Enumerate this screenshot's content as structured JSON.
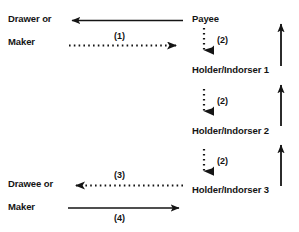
{
  "diagram": {
    "background_color": "#ffffff",
    "ink_color": "#141414",
    "nodes": {
      "drawer": {
        "line1": "Drawer or",
        "line2": "Maker"
      },
      "drawee": {
        "line1": "Drawee or",
        "line2": "Maker"
      },
      "payee": "Payee",
      "holder1": "Holder/Indorser 1",
      "holder2": "Holder/Indorser 2",
      "holder3": "Holder/Indorser 3"
    },
    "edge_labels": {
      "e1": "(1)",
      "e2a": "(2)",
      "e2b": "(2)",
      "e2c": "(2)",
      "e3": "(3)",
      "e4": "(4)"
    }
  }
}
